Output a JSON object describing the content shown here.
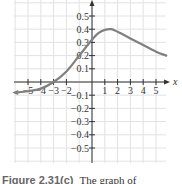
{
  "chart_data": {
    "type": "line",
    "title": "",
    "xlabel": "x",
    "ylabel": "y",
    "xlim": [
      -6,
      6
    ],
    "ylim": [
      -0.6,
      0.6
    ],
    "grid": true,
    "x_ticks": [
      -5,
      -4,
      -3,
      -2,
      1,
      2,
      3,
      4,
      5
    ],
    "x_tick_labels": [
      "−5",
      "−4",
      "−3",
      "−2",
      "1",
      "2",
      "3",
      "4",
      "5"
    ],
    "y_ticks": [
      0.5,
      0.4,
      0.3,
      0.2,
      0.1,
      -0.1,
      -0.2,
      -0.3,
      -0.4,
      -0.5
    ],
    "y_tick_labels": [
      "0.5",
      "0.4",
      "0.3",
      "0.2",
      "0.1",
      "−0.1",
      "−0.2",
      "−0.3",
      "−0.4",
      "−0.5"
    ],
    "series": [
      {
        "name": "f(x)",
        "color": "#808080",
        "x": [
          -6,
          -5,
          -4,
          -3,
          -2,
          -1,
          0,
          0.5,
          1,
          1.5,
          2,
          3,
          4,
          5,
          5.8
        ],
        "y": [
          -0.08,
          -0.07,
          -0.05,
          0.0,
          0.08,
          0.2,
          0.32,
          0.37,
          0.395,
          0.4,
          0.38,
          0.33,
          0.28,
          0.23,
          0.2
        ]
      }
    ]
  },
  "axis": {
    "x_label": "x"
  },
  "caption": {
    "label": "Figure  2.31(c)",
    "text": "The graph of"
  }
}
